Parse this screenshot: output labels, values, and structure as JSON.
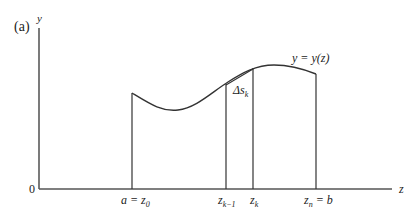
{
  "figure": {
    "panel_label": "(a)",
    "axes": {
      "y_label": "y",
      "x_label": "z",
      "origin_label": "0"
    },
    "curve_label": "y = y(z)",
    "segment_label": "Δs",
    "segment_label_sub": "k",
    "ticks": [
      {
        "main": "a = z",
        "sub": "0"
      },
      {
        "main": "z",
        "sub": "k−1"
      },
      {
        "main": "z",
        "sub": "k"
      },
      {
        "main": "z",
        "sub": "n",
        "suffix": " = b"
      }
    ],
    "colors": {
      "line": "#333333",
      "background": "#ffffff"
    }
  }
}
